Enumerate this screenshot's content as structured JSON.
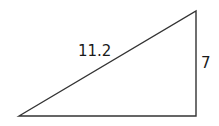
{
  "diagram": {
    "type": "right-triangle",
    "vertices": {
      "bottom_left": [
        19,
        116
      ],
      "top_right": [
        196,
        11
      ],
      "bottom_right": [
        196,
        116
      ]
    },
    "labels": {
      "hypotenuse": "11.2",
      "vertical_leg": "7"
    },
    "stroke_color": "#333333",
    "background": "#ffffff"
  }
}
